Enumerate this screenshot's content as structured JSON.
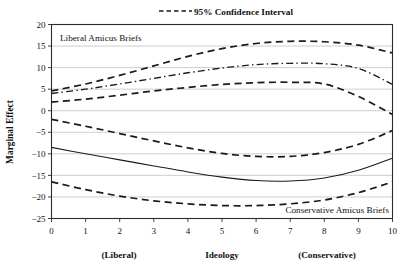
{
  "legend": {
    "position": "top-center",
    "entries": [
      {
        "label": "95% Confidence Interval",
        "style": "dashed"
      }
    ]
  },
  "annotations": {
    "upper_group": "Liberal Amicus Briefs",
    "lower_group": "Conservative Amicus Briefs"
  },
  "axes": {
    "ylabel": "Marginal Effect",
    "xlabel": "Ideology",
    "x_left_anchor": "(Liberal)",
    "x_right_anchor": "(Conservative)",
    "yticks": [
      "20",
      "15",
      "10",
      "5",
      "0",
      "−5",
      "−10",
      "−15",
      "−20",
      "−25"
    ],
    "xticks": [
      "0",
      "1",
      "2",
      "3",
      "4",
      "5",
      "6",
      "7",
      "8",
      "9",
      "10"
    ]
  },
  "chart_data": {
    "type": "line",
    "title": "",
    "subtitle": "",
    "xlabel": "Ideology",
    "ylabel": "Marginal Effect",
    "xlim": [
      0,
      10
    ],
    "ylim": [
      -25,
      20
    ],
    "ytick_values": [
      20,
      15,
      10,
      5,
      0,
      -5,
      -10,
      -15,
      -20,
      -25
    ],
    "xtick_values": [
      0,
      1,
      2,
      3,
      4,
      5,
      6,
      7,
      8,
      9,
      10
    ],
    "grid": "horizontal",
    "legend_position": "top-center",
    "x": [
      0,
      1,
      2,
      3,
      4,
      5,
      6,
      7,
      8,
      9,
      10
    ],
    "series": [
      {
        "name": "Liberal Amicus Briefs — upper 95% CI",
        "group": "Liberal Amicus Briefs",
        "role": "ci_upper",
        "style": "dashed",
        "values": [
          4.6,
          6.2,
          8.2,
          10.4,
          12.6,
          14.4,
          15.6,
          16.1,
          16.0,
          15.2,
          13.4
        ]
      },
      {
        "name": "Liberal Amicus Briefs — marginal effect",
        "group": "Liberal Amicus Briefs",
        "role": "estimate",
        "style": "dash-dot",
        "values": [
          4.0,
          5.0,
          6.2,
          7.5,
          8.8,
          9.9,
          10.7,
          11.0,
          10.9,
          9.8,
          6.1
        ]
      },
      {
        "name": "Liberal Amicus Briefs — lower 95% CI",
        "group": "Liberal Amicus Briefs",
        "role": "ci_lower",
        "style": "dashed",
        "values": [
          2.0,
          2.7,
          3.6,
          4.6,
          5.4,
          6.1,
          6.5,
          6.6,
          6.2,
          3.3,
          -0.9
        ]
      },
      {
        "name": "Conservative Amicus Briefs — upper 95% CI",
        "group": "Conservative Amicus Briefs",
        "role": "ci_upper",
        "style": "dashed",
        "values": [
          -2.0,
          -3.6,
          -5.3,
          -7.0,
          -8.6,
          -9.9,
          -10.6,
          -10.6,
          -9.7,
          -7.8,
          -4.6
        ]
      },
      {
        "name": "Conservative Amicus Briefs — marginal effect",
        "group": "Conservative Amicus Briefs",
        "role": "estimate",
        "style": "solid",
        "values": [
          -8.5,
          -10.0,
          -11.4,
          -12.8,
          -14.2,
          -15.4,
          -16.2,
          -16.3,
          -15.6,
          -13.8,
          -11.0
        ]
      },
      {
        "name": "Conservative Amicus Briefs — lower 95% CI",
        "group": "Conservative Amicus Briefs",
        "role": "ci_lower",
        "style": "dashed",
        "values": [
          -16.5,
          -18.3,
          -19.8,
          -20.9,
          -21.6,
          -22.0,
          -22.0,
          -21.6,
          -20.7,
          -19.0,
          -16.5
        ]
      }
    ]
  }
}
